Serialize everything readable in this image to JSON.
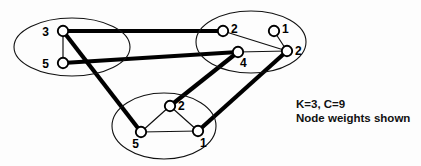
{
  "figure": {
    "background_color": "#fdfdfd",
    "stroke_color": "#111111",
    "node_fill_color": "#ffffff",
    "cut_edge_color": "#000000"
  },
  "caption": {
    "line1": "K=3, C=9",
    "line2": "Node weights shown",
    "k_value": 3,
    "c_value": 9
  },
  "chart_data": {
    "type": "diagram",
    "annotations": [
      "K=3, C=9",
      "Node weights shown"
    ],
    "clusters": [
      {
        "id": "left",
        "cx": 72,
        "cy": 47,
        "rx": 58,
        "ry": 29,
        "nodes": [
          {
            "id": "L1",
            "weight": "3",
            "x": 63,
            "y": 31,
            "label_dx": -14,
            "label_dy": 5
          },
          {
            "id": "L2",
            "weight": "5",
            "x": 63,
            "y": 63,
            "label_dx": -14,
            "label_dy": 5
          }
        ]
      },
      {
        "id": "right",
        "cx": 251,
        "cy": 42,
        "rx": 55,
        "ry": 31,
        "nodes": [
          {
            "id": "R1",
            "weight": "2",
            "x": 223,
            "y": 31,
            "label_dx": 8,
            "label_dy": 2
          },
          {
            "id": "R2",
            "weight": "1",
            "x": 274,
            "y": 31,
            "label_dx": 8,
            "label_dy": 2
          },
          {
            "id": "R3",
            "weight": "4",
            "x": 238,
            "y": 52,
            "label_dx": 2,
            "label_dy": 15
          },
          {
            "id": "R4",
            "weight": "2",
            "x": 287,
            "y": 51,
            "label_dx": 8,
            "label_dy": 4
          }
        ]
      },
      {
        "id": "bottom",
        "cx": 164,
        "cy": 126,
        "rx": 52,
        "ry": 33,
        "nodes": [
          {
            "id": "B1",
            "weight": "2",
            "x": 170,
            "y": 106,
            "label_dx": 8,
            "label_dy": 4
          },
          {
            "id": "B2",
            "weight": "5",
            "x": 141,
            "y": 132,
            "label_dx": -2,
            "label_dy": 16
          },
          {
            "id": "B3",
            "weight": "1",
            "x": 198,
            "y": 131,
            "label_dx": 2,
            "label_dy": 16
          }
        ]
      }
    ],
    "intra_edges": [
      {
        "from": "L1",
        "to": "L2"
      },
      {
        "from": "R1",
        "to": "R4"
      },
      {
        "from": "R2",
        "to": "R4"
      },
      {
        "from": "R3",
        "to": "R4"
      },
      {
        "from": "B1",
        "to": "B2"
      },
      {
        "from": "B1",
        "to": "B3"
      },
      {
        "from": "B2",
        "to": "B3"
      }
    ],
    "cut_edges": [
      {
        "from": "L1",
        "to": "R1"
      },
      {
        "from": "L2",
        "to": "R3"
      },
      {
        "from": "L1",
        "to": "B2"
      },
      {
        "from": "R3",
        "to": "B1"
      },
      {
        "from": "R4",
        "to": "B3"
      }
    ],
    "node_radius": 5.2,
    "cut_count": 9,
    "partition_count": 3
  }
}
